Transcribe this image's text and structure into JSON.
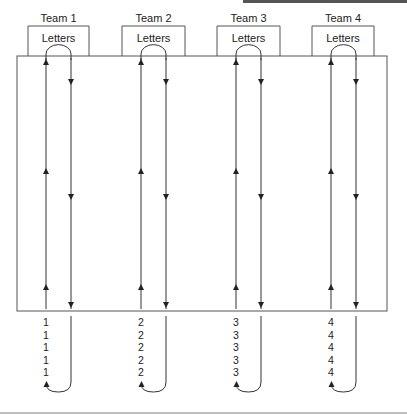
{
  "diagram": {
    "title": "",
    "stroke_color": "#333333",
    "background": "#ffffff",
    "teams": [
      {
        "label": "Team 1",
        "box_label": "Letters",
        "number": "1",
        "box_x": 28,
        "box_w": 61,
        "up_x": 46,
        "down_x": 71
      },
      {
        "label": "Team 2",
        "box_label": "Letters",
        "number": "2",
        "box_x": 122,
        "box_w": 63,
        "up_x": 141,
        "down_x": 166
      },
      {
        "label": "Team 3",
        "box_label": "Letters",
        "number": "3",
        "box_x": 217,
        "box_w": 63,
        "up_x": 236,
        "down_x": 261
      },
      {
        "label": "Team 4",
        "box_label": "Letters",
        "number": "4",
        "box_x": 312,
        "box_w": 62,
        "up_x": 331,
        "down_x": 356
      }
    ],
    "numbers_per_team": 5,
    "main_area": {
      "x": 17,
      "y": 56,
      "w": 370,
      "h": 255
    }
  }
}
